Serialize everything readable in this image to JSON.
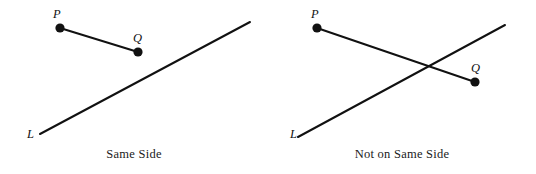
{
  "figure": {
    "background_color": "#ffffff",
    "ink_color": "#111111",
    "width": 536,
    "height": 174
  },
  "panels": [
    {
      "id": "same-side",
      "caption": "Same Side",
      "line": {
        "label": "L",
        "label_x": 27,
        "label_y": 128,
        "x1": 40,
        "y1": 134,
        "x2": 250,
        "y2": 22
      },
      "points": [
        {
          "name": "P",
          "label": "P",
          "x": 60,
          "y": 28,
          "label_x": 53,
          "label_y": 8
        },
        {
          "name": "Q",
          "label": "Q",
          "x": 138,
          "y": 52,
          "label_x": 133,
          "label_y": 32
        }
      ],
      "segment": {
        "from": "P",
        "to": "Q",
        "x1": 60,
        "y1": 28,
        "x2": 138,
        "y2": 52
      },
      "crossing": false
    },
    {
      "id": "not-same-side",
      "caption": "Not on Same Side",
      "line": {
        "label": "L",
        "label_x": 22,
        "label_y": 128,
        "x1": 30,
        "y1": 137,
        "x2": 237,
        "y2": 25
      },
      "points": [
        {
          "name": "P",
          "label": "P",
          "x": 49,
          "y": 28,
          "label_x": 43,
          "label_y": 8
        },
        {
          "name": "Q",
          "label": "Q",
          "x": 207,
          "y": 82,
          "label_x": 203,
          "label_y": 62
        }
      ],
      "segment": {
        "from": "P",
        "to": "Q",
        "x1": 49,
        "y1": 28,
        "x2": 207,
        "y2": 82
      },
      "crossing": true
    }
  ]
}
